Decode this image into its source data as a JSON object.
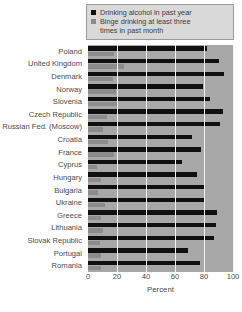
{
  "legend": {
    "entries": [
      {
        "label": "Drinking alcohol in past year",
        "color": "#101010",
        "swatch": "dark-square-icon"
      },
      {
        "label": "Binge drinking at least three",
        "color": "#8c8c8c",
        "swatch": "gray-square-icon"
      }
    ],
    "continuation": "times in past month"
  },
  "axis": {
    "x_title": "Percent",
    "x_ticks": [
      "0",
      "20",
      "40",
      "60",
      "80",
      "100"
    ]
  },
  "footer": {
    "text": ""
  },
  "chart_data": {
    "type": "bar",
    "orientation": "horizontal",
    "title": "",
    "xlabel": "Percent",
    "ylabel": "",
    "xlim": [
      0,
      100
    ],
    "grid": true,
    "grid_axis": "x",
    "legend_position": "top-right",
    "plot_background": "#a8a8a8",
    "categories": [
      "Poland",
      "United Kingdom",
      "Denmark",
      "Norway",
      "Slovenia",
      "Czech Republic",
      "Russian Fed. (Moscow)",
      "Croatia",
      "France",
      "Cyprus",
      "Hungary",
      "Bulgaria",
      "Ukraine",
      "Greece",
      "Lithuania",
      "Slovak Republic",
      "Portugal",
      "Romania"
    ],
    "series": [
      {
        "name": "Drinking alcohol in past year",
        "color": "#101010",
        "values": [
          82,
          90,
          94,
          79,
          84,
          93,
          91,
          72,
          78,
          65,
          75,
          80,
          80,
          89,
          88,
          87,
          69,
          77
        ]
      },
      {
        "name": "Binge drinking at least three times in past month",
        "color": "#8c8c8c",
        "values": [
          18,
          25,
          17,
          19,
          20,
          13,
          10,
          14,
          18,
          6,
          9,
          7,
          12,
          9,
          10,
          8,
          9,
          9
        ]
      }
    ]
  }
}
